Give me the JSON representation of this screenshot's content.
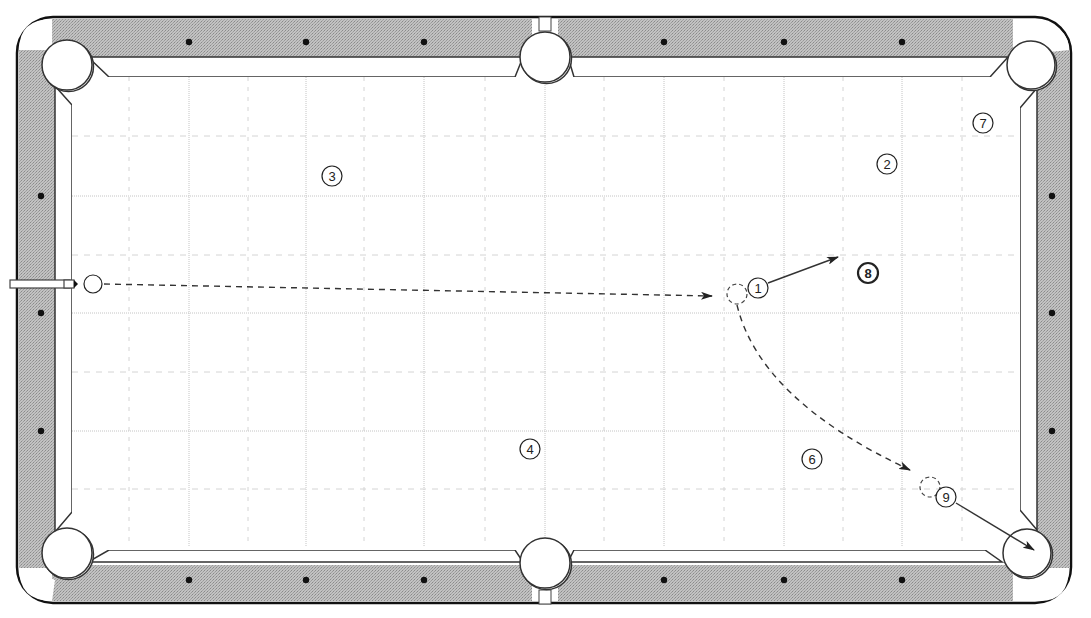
{
  "diagram": {
    "type": "pool-table-shot-diagram",
    "colors": {
      "rail": "#b8b8b8",
      "rail_outline": "#222222",
      "cloth": "#ffffff",
      "grid_major": "#c4c4c4",
      "grid_minor": "#d4d4d4",
      "line": "#333333",
      "diamond": "#111111"
    },
    "table": {
      "outer": {
        "x": 17,
        "y": 17,
        "w": 1054,
        "h": 586,
        "r": 36
      },
      "field": {
        "x": 72,
        "y": 77,
        "w": 948,
        "h": 470
      }
    },
    "pockets": [
      {
        "id": "top-left",
        "cx": 67,
        "cy": 65,
        "r": 25
      },
      {
        "id": "top-side",
        "cx": 545,
        "cy": 57,
        "r": 25
      },
      {
        "id": "top-right",
        "cx": 1031,
        "cy": 65,
        "r": 24
      },
      {
        "id": "bottom-left",
        "cx": 67,
        "cy": 553,
        "r": 25
      },
      {
        "id": "bottom-side",
        "cx": 545,
        "cy": 563,
        "r": 25
      },
      {
        "id": "bottom-right",
        "cx": 1027,
        "cy": 553,
        "r": 24
      }
    ],
    "diamonds": {
      "top": [
        189,
        306,
        424,
        664,
        784,
        902
      ],
      "bottom": [
        189,
        306,
        424,
        664,
        784,
        902
      ],
      "left": [
        196,
        313,
        431
      ],
      "right": [
        196,
        313,
        431
      ]
    },
    "grid": {
      "vertical_major": [
        189,
        306,
        424,
        545,
        664,
        784,
        902
      ],
      "vertical_minor": [
        129,
        248,
        364,
        485,
        604,
        724,
        843,
        962
      ],
      "horizontal_major": [
        196,
        313,
        431
      ],
      "horizontal_minor": [
        136,
        255,
        372,
        489
      ]
    },
    "cue_stick": {
      "x1": 15,
      "y1": 284,
      "x2": 78,
      "y2": 284
    },
    "balls": [
      {
        "id": "cue",
        "label": "",
        "cx": 93,
        "cy": 284,
        "r": 9
      },
      {
        "id": "1",
        "label": "1",
        "cx": 758,
        "cy": 288,
        "r": 10
      },
      {
        "id": "2",
        "label": "2",
        "cx": 887,
        "cy": 164,
        "r": 10
      },
      {
        "id": "3",
        "label": "3",
        "cx": 332,
        "cy": 176,
        "r": 10
      },
      {
        "id": "4",
        "label": "4",
        "cx": 530,
        "cy": 449,
        "r": 10
      },
      {
        "id": "6",
        "label": "6",
        "cx": 812,
        "cy": 459,
        "r": 10
      },
      {
        "id": "7",
        "label": "7",
        "cx": 983,
        "cy": 123,
        "r": 10
      },
      {
        "id": "8",
        "label": "8",
        "cx": 868,
        "cy": 273,
        "r": 10,
        "bold": true
      },
      {
        "id": "9",
        "label": "9",
        "cx": 946,
        "cy": 497,
        "r": 10
      }
    ],
    "ghost_balls": [
      {
        "id": "ghost-1",
        "cx": 737,
        "cy": 294,
        "r": 10
      },
      {
        "id": "ghost-2",
        "cx": 930,
        "cy": 487,
        "r": 10
      }
    ],
    "paths": [
      {
        "id": "cue-ball-path",
        "style": "dashed",
        "d": "M 104 284 L 712 296",
        "arrow_at": [
          712,
          296
        ],
        "arrow_angle": 1.1
      },
      {
        "id": "object-ball-1-path",
        "style": "solid",
        "d": "M 768 283 L 838 257",
        "arrow_at": [
          838,
          257
        ],
        "arrow_angle": -20.4
      },
      {
        "id": "cue-ball-curve-path",
        "style": "dashed",
        "d": "M 737 305 Q 760 400 910 470",
        "arrow_at": [
          910,
          470
        ],
        "arrow_angle": 25
      },
      {
        "id": "object-ball-9-path",
        "style": "solid",
        "d": "M 956 503 L 1034 550",
        "arrow_at": [
          1034,
          550
        ],
        "arrow_angle": 31
      }
    ]
  }
}
